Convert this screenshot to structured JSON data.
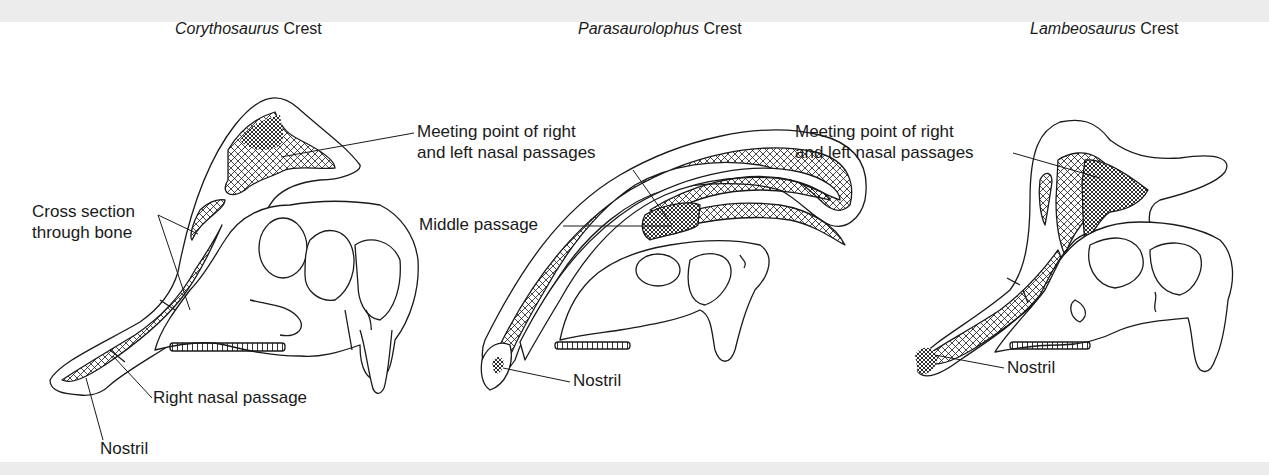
{
  "figure": {
    "panels": [
      {
        "genus": "Corythosaurus",
        "suffix": "Crest",
        "labels": {
          "meeting": [
            "Meeting point of right",
            "and left nasal passages"
          ],
          "cross_section": [
            "Cross section",
            "through bone"
          ],
          "right_passage": "Right nasal passage",
          "nostril": "Nostril"
        }
      },
      {
        "genus": "Parasaurolophus",
        "suffix": "Crest",
        "labels": {
          "middle": "Middle passage",
          "nostril": "Nostril"
        }
      },
      {
        "genus": "Lambeosaurus",
        "suffix": "Crest",
        "labels": {
          "meeting": [
            "Meeting point of right",
            "and left nasal passages"
          ],
          "nostril": "Nostril"
        }
      }
    ],
    "colors": {
      "ink": "#1a1a1a",
      "paper": "#ffffff",
      "scan_band": "#ececec"
    }
  }
}
